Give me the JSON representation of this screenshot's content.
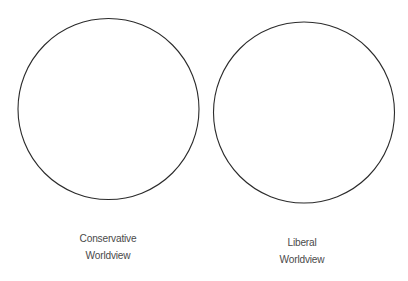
{
  "diagram": {
    "type": "two-circle comparison",
    "stroke_color": "#2b2b2b",
    "text_color": "#4a4a4a",
    "circles": [
      {
        "id": "conservative",
        "label_lines": [
          "Conservative",
          "Worldview"
        ]
      },
      {
        "id": "liberal",
        "label_lines": [
          "Liberal",
          "Worldview"
        ]
      }
    ]
  }
}
